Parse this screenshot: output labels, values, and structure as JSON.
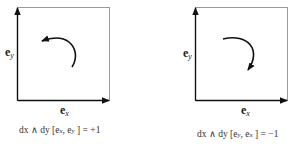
{
  "panels": [
    {
      "id": "positive",
      "basis_vertical": {
        "symbol": "e",
        "subscript": "y"
      },
      "basis_horizontal": {
        "symbol": "e",
        "subscript": "x"
      },
      "rotation": "counterclockwise",
      "caption": "dx ∧ dy [eₓ, eᵧ ] = +1",
      "caption_parts": {
        "form": "dx ∧ dy",
        "args": "[e",
        "a1": "x",
        "sep": ", e",
        "a2": "y",
        "close": " ] = +1"
      }
    },
    {
      "id": "negative",
      "basis_vertical": {
        "symbol": "e",
        "subscript": "y"
      },
      "basis_horizontal": {
        "symbol": "e",
        "subscript": "x"
      },
      "rotation": "clockwise",
      "caption": "dx ∧ dy [eᵧ, eₓ ] = −1",
      "caption_parts": {
        "form": "dx ∧ dy",
        "args": "[e",
        "a1": "y",
        "sep": ", e",
        "a2": "x",
        "close": " ] = −1"
      }
    }
  ],
  "colors": {
    "line": "#111111",
    "frame": "#9a9a9a",
    "text": "#222222"
  }
}
